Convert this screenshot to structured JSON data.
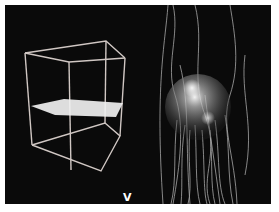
{
  "figure": {
    "panel_label": "V",
    "left_panel": {
      "description": "Wireframe box with horizontal slice plane",
      "wire_color": "#e8e0dc",
      "plane_color": "#f2f2f2"
    },
    "right_panel": {
      "description": "Glowing sphere with fibrous streamlines",
      "fiber_color": "#d8d8d8",
      "sphere_highlight": "#ffffff"
    },
    "background_color": "#0a0a0a",
    "border_color": "#ffffff"
  }
}
